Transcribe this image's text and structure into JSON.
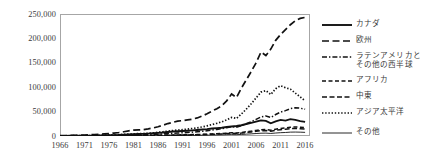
{
  "chart_data": {
    "type": "line",
    "title": "",
    "xlabel": "",
    "ylabel": "",
    "grid": false,
    "legend_position": "right",
    "xlim": [
      1966,
      2017
    ],
    "ylim": [
      0,
      250000
    ],
    "y_ticks": [
      "0",
      "50,000",
      "100,000",
      "150,000",
      "200,000",
      "250,000"
    ],
    "y_tick_values": [
      0,
      50000,
      100000,
      150000,
      200000,
      250000
    ],
    "x_ticks": [
      "1966",
      "1971",
      "1976",
      "1981",
      "1986",
      "1991",
      "1996",
      "2001",
      "2006",
      "2011",
      "2016"
    ],
    "x_tick_values": [
      1966,
      1971,
      1976,
      1981,
      1986,
      1991,
      1996,
      2001,
      2006,
      2011,
      2016
    ],
    "x": [
      1966,
      1967,
      1968,
      1969,
      1970,
      1971,
      1972,
      1973,
      1974,
      1975,
      1976,
      1977,
      1978,
      1979,
      1980,
      1981,
      1982,
      1983,
      1984,
      1985,
      1986,
      1987,
      1988,
      1989,
      1990,
      1991,
      1992,
      1993,
      1994,
      1995,
      1996,
      1997,
      1998,
      1999,
      2000,
      2001,
      2002,
      2003,
      2004,
      2005,
      2006,
      2007,
      2008,
      2009,
      2010,
      2011,
      2012,
      2013,
      2014,
      2015,
      2016
    ],
    "series": [
      {
        "name": "カナダ",
        "style": "solid",
        "values": [
          300,
          350,
          400,
          450,
          520,
          600,
          700,
          850,
          1000,
          1200,
          1500,
          1800,
          2100,
          2600,
          3100,
          3700,
          4000,
          4300,
          4900,
          5600,
          6400,
          7200,
          8300,
          9100,
          9800,
          10200,
          10800,
          11600,
          12400,
          13200,
          14100,
          15400,
          16200,
          17000,
          18500,
          19500,
          20500,
          22000,
          24500,
          27000,
          29500,
          32000,
          31000,
          26000,
          30000,
          33000,
          31500,
          34500,
          33000,
          30500,
          29000
        ]
      },
      {
        "name": "欧州",
        "style": "longdash",
        "values": [
          800,
          950,
          1100,
          1300,
          1600,
          1900,
          2400,
          3000,
          3600,
          4200,
          5000,
          6000,
          7200,
          8700,
          10500,
          12000,
          12500,
          13000,
          14500,
          16500,
          19000,
          22000,
          25500,
          28000,
          30500,
          31500,
          33000,
          34500,
          37000,
          41000,
          45500,
          51000,
          56000,
          62000,
          72000,
          86000,
          79000,
          98000,
          115000,
          132000,
          150000,
          172000,
          165000,
          178000,
          196000,
          208000,
          218000,
          228000,
          236000,
          241000,
          243000
        ]
      },
      {
        "name": "ラテンアメリカと\nその他の西半球",
        "style": "dashdot",
        "values": [
          200,
          230,
          260,
          300,
          350,
          420,
          500,
          600,
          720,
          860,
          1000,
          1200,
          1450,
          1700,
          2000,
          2300,
          2450,
          2600,
          2900,
          3300,
          3800,
          4400,
          5100,
          5700,
          6200,
          6600,
          7200,
          7900,
          8700,
          9600,
          10800,
          12200,
          13500,
          15000,
          17000,
          19000,
          18000,
          21000,
          25000,
          29000,
          34000,
          39000,
          41000,
          38000,
          44000,
          49000,
          52000,
          56000,
          58000,
          57000,
          55000
        ]
      },
      {
        "name": "アフリカ",
        "style": "dash",
        "values": [
          100,
          110,
          125,
          140,
          160,
          185,
          215,
          250,
          290,
          340,
          400,
          470,
          550,
          640,
          750,
          860,
          910,
          960,
          1080,
          1220,
          1400,
          1600,
          1850,
          2050,
          2250,
          2400,
          2600,
          2850,
          3100,
          3400,
          3800,
          4300,
          4700,
          5200,
          5900,
          6500,
          6200,
          7200,
          8600,
          10000,
          11500,
          13000,
          13500,
          12000,
          14000,
          15500,
          16500,
          18000,
          18500,
          18000,
          17000
        ]
      },
      {
        "name": "中東",
        "style": "middash",
        "values": [
          80,
          90,
          100,
          115,
          130,
          150,
          175,
          205,
          240,
          280,
          330,
          390,
          460,
          540,
          630,
          720,
          760,
          800,
          900,
          1020,
          1170,
          1340,
          1550,
          1720,
          1880,
          2000,
          2170,
          2380,
          2600,
          2850,
          3180,
          3600,
          3950,
          4350,
          4950,
          5450,
          5200,
          6050,
          7200,
          8400,
          9650,
          10900,
          11300,
          10000,
          11700,
          13000,
          13800,
          15100,
          15500,
          15000,
          14200
        ]
      },
      {
        "name": "アジア太平洋",
        "style": "dotted",
        "values": [
          400,
          460,
          530,
          610,
          700,
          820,
          960,
          1150,
          1380,
          1650,
          1950,
          2350,
          2800,
          3300,
          3900,
          4500,
          4800,
          5100,
          5700,
          6500,
          7500,
          8700,
          10000,
          11200,
          12200,
          13000,
          14000,
          15400,
          16800,
          18500,
          20800,
          23500,
          26000,
          29000,
          33000,
          38000,
          36000,
          45000,
          55000,
          66000,
          78000,
          90000,
          93000,
          85000,
          97000,
          103000,
          99000,
          96000,
          88000,
          80000,
          72000
        ]
      },
      {
        "name": "その他",
        "style": "thin",
        "values": [
          50,
          55,
          60,
          68,
          78,
          90,
          104,
          120,
          140,
          163,
          190,
          222,
          258,
          300,
          350,
          400,
          420,
          445,
          495,
          560,
          640,
          730,
          840,
          930,
          1010,
          1080,
          1160,
          1270,
          1390,
          1520,
          1690,
          1900,
          2090,
          2300,
          2600,
          2870,
          2750,
          3180,
          3800,
          4400,
          5060,
          5700,
          5900,
          5250,
          6100,
          6800,
          7200,
          7900,
          8100,
          7850,
          7450
        ]
      }
    ]
  }
}
